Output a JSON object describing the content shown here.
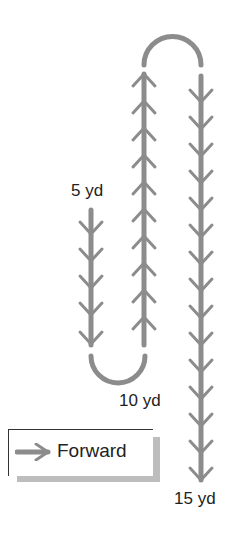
{
  "diagram": {
    "type": "route-path",
    "line_color": "#8c8c8c",
    "labels": {
      "start": "5 yd",
      "turn": "10 yd",
      "end": "15 yd"
    },
    "segments": [
      {
        "name": "first-run",
        "direction": "down",
        "chevrons": 5
      },
      {
        "name": "bottom-turn",
        "shape": "u-turn"
      },
      {
        "name": "second-run",
        "direction": "up",
        "chevrons": 10
      },
      {
        "name": "top-turn",
        "shape": "u-turn"
      },
      {
        "name": "third-run",
        "direction": "down",
        "chevrons": 15
      }
    ],
    "legend": {
      "icon": "arrow-right-icon",
      "label": "Forward"
    }
  }
}
